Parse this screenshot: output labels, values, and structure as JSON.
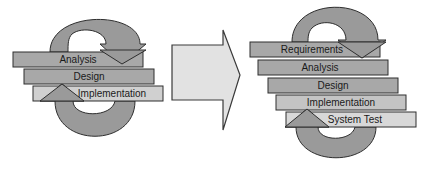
{
  "left_diagram": {
    "title": "Traditional lifecycle",
    "phases": [
      {
        "label": "Analysis",
        "x": 13,
        "y": 52,
        "w": 130,
        "h": 15,
        "fill": "#a8a8a8"
      },
      {
        "label": "Design",
        "x": 24,
        "y": 69,
        "w": 130,
        "h": 15,
        "fill": "#a8a8a8"
      },
      {
        "label": "Implementation",
        "x": 33,
        "y": 86,
        "w": 130,
        "h": 15,
        "fill": "#d0d0d0"
      }
    ]
  },
  "transition_arrow": {
    "direction": "right",
    "fill": "#e2e2e2",
    "stroke": "#3a3a3a"
  },
  "right_diagram": {
    "title": "Extended lifecycle",
    "phases": [
      {
        "label": "Requirements",
        "x": 250,
        "y": 42,
        "w": 130,
        "h": 15,
        "fill": "#a8a8a8"
      },
      {
        "label": "Analysis",
        "x": 258,
        "y": 60,
        "w": 130,
        "h": 15,
        "fill": "#a8a8a8"
      },
      {
        "label": "Design",
        "x": 268,
        "y": 78,
        "w": 130,
        "h": 15,
        "fill": "#a8a8a8"
      },
      {
        "label": "Implementation",
        "x": 276,
        "y": 95,
        "w": 130,
        "h": 15,
        "fill": "#c4c4c4"
      },
      {
        "label": "System Test",
        "x": 286,
        "y": 112,
        "w": 130,
        "h": 15,
        "fill": "#d8d8d8"
      }
    ]
  },
  "colors": {
    "loop_fill": "#9a9a9a",
    "outline": "#2e2e2e",
    "background": "#ffffff"
  }
}
